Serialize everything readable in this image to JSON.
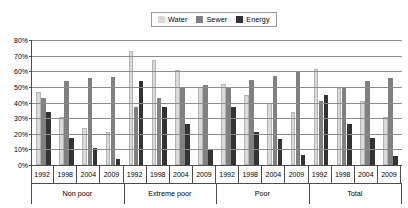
{
  "legend": {
    "position": "top-center",
    "entries": [
      {
        "label": "Water",
        "color": "#d9d9d9",
        "name": "legend-item-water"
      },
      {
        "label": "Sewer",
        "color": "#808080",
        "name": "legend-item-sewer"
      },
      {
        "label": "Energy",
        "color": "#333333",
        "name": "legend-item-energy"
      }
    ]
  },
  "axis": {
    "y_ticks": [
      "0%",
      "10%",
      "20%",
      "30%",
      "40%",
      "50%",
      "60%",
      "70%",
      "80%"
    ]
  },
  "chart_data": {
    "type": "bar",
    "title": "",
    "subtitle": "",
    "xlabel": "",
    "ylabel": "",
    "ylim": [
      0,
      80
    ],
    "ytick_values": [
      0,
      10,
      20,
      30,
      40,
      50,
      60,
      70,
      80
    ],
    "ytick_labels": [
      "0%",
      "10%",
      "20%",
      "30%",
      "40%",
      "50%",
      "60%",
      "70%",
      "80%"
    ],
    "grid": true,
    "legend_position": "top-center",
    "group_labels": [
      "Non poor",
      "Extreme poor",
      "Poor",
      "Total"
    ],
    "categories": [
      "1992",
      "1998",
      "2004",
      "2009"
    ],
    "series": [
      {
        "name": "Water",
        "color": "#d9d9d9",
        "values_by_group": {
          "Non poor": [
            47,
            31,
            24,
            21
          ],
          "Extreme poor": [
            73,
            67,
            61,
            50
          ],
          "Poor": [
            52,
            45,
            40,
            34
          ],
          "Total": [
            61.5,
            49.5,
            41,
            30.5
          ]
        }
      },
      {
        "name": "Sewer",
        "color": "#808080",
        "values_by_group": {
          "Non poor": [
            43,
            54,
            56,
            56.5
          ],
          "Extreme poor": [
            37,
            43,
            50,
            51.5
          ],
          "Poor": [
            49,
            54.5,
            57,
            59.5
          ],
          "Total": [
            41,
            49.5,
            53.5,
            55.5
          ]
        }
      },
      {
        "name": "Energy",
        "color": "#333333",
        "values_by_group": {
          "Non poor": [
            34,
            17,
            11,
            4
          ],
          "Extreme poor": [
            53.5,
            37,
            26,
            10
          ],
          "Poor": [
            37,
            21,
            16.5,
            6.5
          ],
          "Total": [
            45,
            26.5,
            17.5,
            6
          ]
        }
      }
    ]
  },
  "colors": {
    "water": "#d9d9d9",
    "sewer": "#808080",
    "energy": "#333333",
    "axis": "#4d4d4d",
    "gridline": "#8c8c8c",
    "background": "#ffffff"
  }
}
